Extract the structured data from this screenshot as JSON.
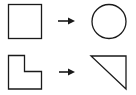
{
  "diagram": {
    "description": "Shape transformation analogy: square maps to circle, L-shape maps to right triangle",
    "stroke_color": "#1a1a1a",
    "background": "#ffffff",
    "rows": [
      {
        "source": {
          "shape": "square",
          "label": "square"
        },
        "arrow": {
          "direction": "right",
          "icon": "arrow-right-icon"
        },
        "target": {
          "shape": "circle",
          "label": "circle"
        }
      },
      {
        "source": {
          "shape": "l-shape",
          "label": "L-shape"
        },
        "arrow": {
          "direction": "right",
          "icon": "arrow-right-icon"
        },
        "target": {
          "shape": "right-triangle",
          "label": "right triangle"
        }
      }
    ]
  }
}
